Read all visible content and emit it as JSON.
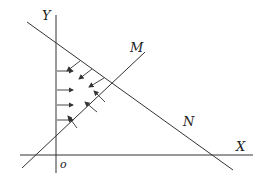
{
  "diagram": {
    "labels": {
      "y_axis": "Y",
      "x_axis": "X",
      "origin": "o",
      "line_m": "M",
      "line_n": "N"
    },
    "colors": {
      "line": "#333333",
      "background": "#ffffff"
    },
    "elements": {
      "y_axis": {
        "x1": 56,
        "y1": 15,
        "x2": 56,
        "y2": 173
      },
      "x_axis": {
        "x1": 20,
        "y1": 155,
        "x2": 253,
        "y2": 155
      },
      "line_m": {
        "x1": 22,
        "y1": 168,
        "x2": 145,
        "y2": 52
      },
      "line_n": {
        "x1": 27,
        "y1": 22,
        "x2": 233,
        "y2": 170
      },
      "arrows_from_y_axis": 4,
      "arrows_from_line_n": 3,
      "arrows_from_line_m": 3
    }
  }
}
